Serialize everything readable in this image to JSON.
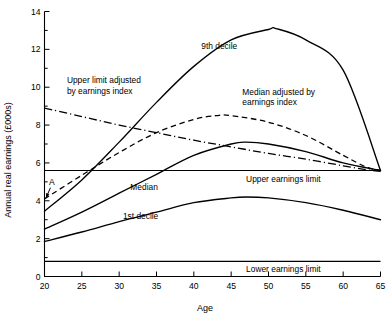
{
  "chart_data": {
    "type": "line",
    "title": "",
    "xlabel": "Age",
    "ylabel": "Annual real earnings (£000s)",
    "xlim": [
      20,
      65
    ],
    "ylim": [
      0,
      14
    ],
    "xticks": [
      20,
      25,
      30,
      35,
      40,
      45,
      50,
      55,
      60,
      65
    ],
    "xtick_labels": [
      "20",
      "25",
      "30",
      "35",
      "40",
      "45",
      "50",
      "55",
      "60",
      "65"
    ],
    "yticks": [
      0,
      2,
      4,
      6,
      8,
      10,
      12,
      14
    ],
    "ytick_labels": [
      "0",
      "2",
      "4",
      "6",
      "8",
      "10",
      "12",
      "14"
    ],
    "yminor_ticks": [
      1,
      3,
      5,
      7,
      9,
      11,
      13
    ],
    "grid": false,
    "legend": "inline-annotations",
    "series": [
      {
        "name": "9th decile",
        "style": "solid",
        "label": "9th decile",
        "label_x": 41.0,
        "label_y": 12.0,
        "x": [
          20,
          25,
          30,
          35,
          40,
          45,
          50,
          51,
          55,
          60,
          65
        ],
        "y": [
          3.45,
          5.1,
          7.1,
          9.2,
          11.1,
          12.5,
          13.05,
          13.1,
          12.5,
          10.9,
          5.6
        ]
      },
      {
        "name": "Median",
        "style": "solid",
        "label": "Median",
        "label_x": 31.5,
        "label_y": 4.55,
        "x": [
          20,
          25,
          30,
          35,
          40,
          45,
          47,
          50,
          55,
          60,
          65
        ],
        "y": [
          2.5,
          3.4,
          4.4,
          5.4,
          6.4,
          7.0,
          7.1,
          7.0,
          6.6,
          6.0,
          5.6
        ]
      },
      {
        "name": "1st decile",
        "style": "solid",
        "label": "1st decile",
        "label_x": 30.5,
        "label_y": 3.05,
        "x": [
          20,
          25,
          30,
          35,
          40,
          45,
          47,
          50,
          55,
          60,
          65
        ],
        "y": [
          1.85,
          2.35,
          2.9,
          3.4,
          3.9,
          4.15,
          4.2,
          4.15,
          3.9,
          3.5,
          3.0
        ]
      },
      {
        "name": "Median adjusted by earnings index",
        "style": "dashed",
        "label": "Median adjusted by\nearnings index",
        "label_x": 46.5,
        "label_y": 9.6,
        "x": [
          20,
          25,
          30,
          35,
          40,
          43,
          45,
          50,
          55,
          60,
          63,
          65
        ],
        "y": [
          4.1,
          5.35,
          6.55,
          7.6,
          8.3,
          8.5,
          8.5,
          8.15,
          7.45,
          6.4,
          5.8,
          5.6
        ]
      },
      {
        "name": "Upper limit adjusted by earnings index",
        "style": "dashdot",
        "label": "Upper limit adjusted\nby earnings index",
        "label_x": 23.0,
        "label_y": 10.2,
        "x": [
          20,
          25,
          30,
          35,
          40,
          45,
          50,
          55,
          60,
          63,
          65
        ],
        "y": [
          8.9,
          8.45,
          8.0,
          7.6,
          7.2,
          6.85,
          6.5,
          6.2,
          5.85,
          5.65,
          5.55
        ]
      }
    ],
    "reference_lines": [
      {
        "name": "Upper earnings limit",
        "label": "Upper earnings limit",
        "value": 5.6,
        "label_x": 47.0,
        "style": "solid"
      },
      {
        "name": "Lower earnings limit",
        "label": "Lower earnings limit",
        "value": 0.8,
        "label_x": 47.0,
        "style": "solid"
      }
    ],
    "annotations": [
      {
        "name": "point-a",
        "label": "A",
        "x": 20.6,
        "y": 4.85,
        "arrow_to_x": 20.05,
        "arrow_to_y": 4.1
      }
    ]
  }
}
